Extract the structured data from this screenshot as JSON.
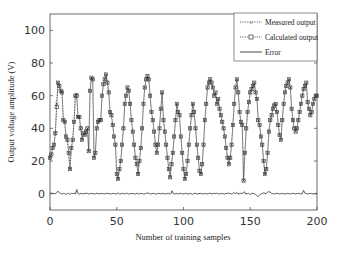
{
  "chart_data": {
    "type": "line",
    "title": "",
    "xlabel": "Number of training samples",
    "ylabel": "Output voltage amplitude (V)",
    "xlim": [
      0,
      200
    ],
    "ylim": [
      -10,
      110
    ],
    "xticks": [
      0,
      50,
      100,
      150,
      200
    ],
    "yticks": [
      0,
      20,
      40,
      60,
      80,
      100
    ],
    "grid": false,
    "legend_position": "upper right",
    "legend": [
      "Measured output",
      "Calculated output",
      "Error"
    ],
    "series": [
      {
        "name": "Measured output",
        "marker": "x",
        "linestyle": "dotted",
        "values": [
          22,
          24,
          28,
          30,
          37,
          55,
          68,
          66,
          63,
          62,
          45,
          44,
          35,
          33,
          25,
          15,
          28,
          33,
          44,
          60,
          61,
          47,
          47,
          40,
          33,
          37,
          36,
          38,
          40,
          26,
          63,
          71,
          70,
          22,
          25,
          40,
          44,
          45,
          45,
          60,
          67,
          70,
          73,
          68,
          62,
          50,
          48,
          42,
          35,
          30,
          12,
          9,
          15,
          20,
          30,
          40,
          55,
          60,
          65,
          63,
          55,
          45,
          38,
          30,
          22,
          18,
          12,
          20,
          28,
          40,
          55,
          65,
          70,
          72,
          70,
          60,
          50,
          45,
          38,
          30,
          25,
          30,
          40,
          52,
          62,
          45,
          38,
          30,
          22,
          15,
          10,
          18,
          25,
          35,
          45,
          55,
          50,
          48,
          35,
          25,
          15,
          9,
          12,
          20,
          30,
          40,
          48,
          55,
          50,
          40,
          30,
          22,
          14,
          12,
          18,
          30,
          45,
          55,
          65,
          68,
          70,
          68,
          65,
          60,
          62,
          55,
          58,
          52,
          48,
          44,
          40,
          35,
          28,
          22,
          18,
          22,
          30,
          42,
          55,
          65,
          70,
          62,
          50,
          44,
          42,
          8,
          25,
          40,
          50,
          56,
          62,
          64,
          66,
          68,
          62,
          58,
          45,
          42,
          35,
          30,
          20,
          12,
          15,
          25,
          38,
          45,
          48,
          52,
          54,
          55,
          50,
          42,
          36,
          33,
          45,
          55,
          62,
          66,
          68,
          70,
          65,
          52,
          45,
          40,
          38,
          40,
          45,
          50,
          55,
          60,
          64,
          66,
          68,
          56,
          52,
          48,
          50,
          55,
          58,
          60,
          60
        ]
      },
      {
        "name": "Calculated output",
        "marker": "s",
        "linestyle": "dotted",
        "values": [
          22,
          24,
          28,
          30,
          37,
          53,
          68,
          66,
          63,
          62,
          45,
          44,
          35,
          33,
          25,
          15,
          28,
          33,
          44,
          60,
          60,
          47,
          47,
          40,
          33,
          37,
          36,
          38,
          40,
          26,
          63,
          71,
          70,
          22,
          25,
          40,
          44,
          45,
          45,
          60,
          67,
          70,
          73,
          68,
          62,
          50,
          48,
          42,
          35,
          30,
          12,
          9,
          15,
          20,
          30,
          40,
          55,
          60,
          65,
          63,
          55,
          45,
          38,
          30,
          22,
          18,
          12,
          20,
          28,
          40,
          55,
          65,
          70,
          72,
          70,
          60,
          50,
          45,
          38,
          30,
          25,
          30,
          40,
          52,
          62,
          45,
          38,
          30,
          22,
          15,
          10,
          18,
          25,
          35,
          45,
          55,
          50,
          48,
          35,
          25,
          15,
          9,
          12,
          20,
          30,
          40,
          48,
          55,
          50,
          40,
          30,
          22,
          14,
          12,
          18,
          30,
          45,
          55,
          65,
          68,
          70,
          68,
          65,
          60,
          62,
          55,
          58,
          52,
          48,
          44,
          40,
          35,
          28,
          22,
          18,
          22,
          30,
          42,
          55,
          65,
          70,
          62,
          50,
          44,
          42,
          8,
          25,
          40,
          50,
          56,
          62,
          64,
          66,
          68,
          62,
          58,
          45,
          42,
          35,
          30,
          20,
          12,
          15,
          25,
          38,
          45,
          48,
          52,
          54,
          55,
          50,
          42,
          36,
          33,
          45,
          55,
          62,
          66,
          68,
          70,
          65,
          52,
          45,
          40,
          38,
          40,
          45,
          50,
          55,
          60,
          64,
          66,
          68,
          56,
          52,
          48,
          50,
          55,
          58,
          60,
          60
        ]
      },
      {
        "name": "Error",
        "marker": "none",
        "linestyle": "solid",
        "values": [
          0,
          0.5,
          0,
          0.3,
          -0.2,
          0.8,
          1.5,
          0.5,
          0,
          -0.3,
          0.2,
          0,
          -0.5,
          0.3,
          0,
          -0.4,
          0.2,
          0,
          0.3,
          -0.2,
          2.5,
          0,
          -0.3,
          0.2,
          0,
          -0.2,
          0.3,
          0,
          0.2,
          -0.3,
          0,
          0.2,
          0,
          -0.2,
          0,
          0.3,
          0,
          -0.2,
          0.2,
          0,
          0,
          -0.2,
          0.3,
          0,
          0.2,
          -0.3,
          0,
          0.2,
          0,
          -0.2,
          0,
          0.5,
          -0.3,
          0,
          0.2,
          0,
          -0.2,
          0.3,
          0,
          -0.3,
          0,
          0.2,
          0,
          -0.2,
          0,
          0.3,
          -0.2,
          0,
          0.2,
          0,
          -0.3,
          0,
          0.2,
          0.5,
          0,
          -0.2,
          0,
          0.2,
          0,
          -0.3,
          0,
          0.2,
          0,
          -0.2,
          0.3,
          0,
          -0.2,
          0,
          0.3,
          0,
          -0.2,
          1.8,
          0,
          -0.3,
          0.2,
          0,
          -0.2,
          0.3,
          0,
          -0.2,
          0,
          0.2,
          0,
          -0.3,
          0,
          0.2,
          -0.5,
          0,
          0.3,
          0,
          -0.2,
          0,
          0.2,
          0,
          -0.3,
          0.2,
          0,
          -0.2,
          0,
          0.3,
          0,
          -0.2,
          0.2,
          0,
          0.3,
          0,
          -0.2,
          0,
          0.2,
          0,
          -0.3,
          0.2,
          0,
          0.5,
          0,
          -0.2,
          0,
          0.8,
          0,
          0.5,
          0,
          -0.2,
          0.3,
          0,
          0.5,
          1.2,
          -0.3,
          0,
          0.2,
          -0.5,
          0,
          0.3,
          0,
          -0.3,
          -1,
          -1.8,
          -1,
          -0.3,
          0,
          0.5,
          0.3,
          0,
          0.8,
          1.2,
          1,
          0.3,
          0,
          -0.2,
          0,
          0.3,
          0,
          -0.2,
          0,
          0.2,
          0,
          -0.3,
          0,
          0.2,
          0,
          -0.2,
          0,
          0.3,
          0,
          -0.2,
          0,
          0.2,
          0,
          -0.2,
          0,
          2,
          0.3,
          0,
          -0.2,
          0,
          0.2,
          0,
          -0.2,
          0,
          0,
          0
        ]
      }
    ]
  },
  "axes": {
    "xlabel": "Number of training samples",
    "ylabel": "Output voltage amplitude (V)",
    "xtick_labels": [
      "0",
      "50",
      "100",
      "150",
      "200"
    ],
    "ytick_labels": [
      "0",
      "20",
      "40",
      "60",
      "80",
      "100"
    ]
  },
  "legend": {
    "items": [
      {
        "label": "Measured output",
        "marker": "x",
        "style": "dotted"
      },
      {
        "label": "Calculated output",
        "marker": "square",
        "style": "dotted"
      },
      {
        "label": "Error",
        "marker": "none",
        "style": "solid"
      }
    ]
  },
  "colors": {
    "line": "#333333",
    "axis": "#444444",
    "background": "#ffffff"
  }
}
